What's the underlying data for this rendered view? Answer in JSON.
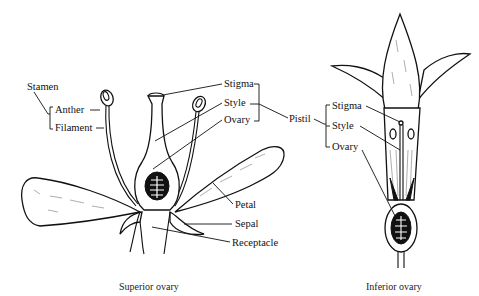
{
  "figure": {
    "superior": {
      "caption": "Superior ovary",
      "labels": {
        "stamen": "Stamen",
        "anther": "Anther",
        "filament": "Filament",
        "stigma": "Stigma",
        "style": "Style",
        "ovary": "Ovary",
        "petal": "Petal",
        "sepal": "Sepal",
        "receptacle": "Receptacle"
      }
    },
    "pistil_label": "Pistil",
    "inferior": {
      "caption": "Inferior ovary",
      "labels": {
        "stigma": "Stigma",
        "style": "Style",
        "ovary": "Ovary"
      }
    }
  }
}
